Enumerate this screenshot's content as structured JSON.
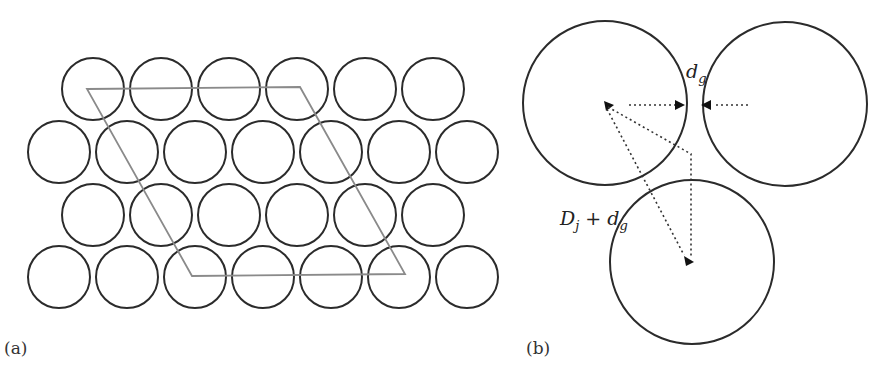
{
  "panel_a": {
    "label": "(a)",
    "description": "Hexagonal close packing of circular fibers with rhombic unit cell",
    "circle_radius": 31,
    "rows": [
      {
        "y": 89,
        "xs": [
          93,
          161,
          229,
          297,
          365,
          433
        ]
      },
      {
        "y": 152,
        "xs": [
          59,
          127,
          195,
          263,
          331,
          399,
          467
        ]
      },
      {
        "y": 215,
        "xs": [
          93,
          161,
          229,
          297,
          365,
          433
        ]
      },
      {
        "y": 277,
        "xs": [
          59,
          127,
          195,
          263,
          331,
          399,
          467
        ]
      }
    ],
    "unit_cell": [
      [
        87,
        89
      ],
      [
        300,
        87
      ],
      [
        405,
        274
      ],
      [
        192,
        276
      ]
    ],
    "colors": {
      "circle_stroke": "#2b2b2b",
      "cell_stroke": "#8a8a8a"
    }
  },
  "panel_b": {
    "label": "(b)",
    "description": "Three adjacent fibers showing gap distance and center spacing",
    "circles": [
      {
        "cx": 605,
        "cy": 103,
        "r": 82
      },
      {
        "cx": 785,
        "cy": 104,
        "r": 82
      },
      {
        "cx": 692,
        "cy": 262,
        "r": 82
      }
    ],
    "gap_label": {
      "main": "d",
      "sub": "g"
    },
    "spacing_label": {
      "D": "D",
      "D_sub": "j",
      "plus": " + ",
      "d": "d",
      "d_sub": "g"
    }
  }
}
